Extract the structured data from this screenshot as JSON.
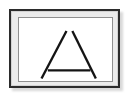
{
  "image": {
    "title": "Framed triangle drawing",
    "width": 133,
    "height": 102,
    "background_color": "#ffffff"
  },
  "frame": {
    "name": "picture-frame",
    "border_color": "#2b2b2b",
    "border_width_px": 2,
    "mat_color": "#ebebeb",
    "mat_border_color": "#d2d2d2",
    "shadow_color": "#b9b9b9",
    "x": 9,
    "y": 9,
    "width": 111,
    "height": 79
  },
  "canvas": {
    "name": "drawing-canvas",
    "background_color": "#ffffff",
    "border_color": "#8f8f8f",
    "x": 6,
    "y": 5,
    "width": 95,
    "height": 65,
    "view_width": 95,
    "view_height": 65
  },
  "drawing": {
    "shape_name": "triangle",
    "stroke_color": "#141414",
    "stroke_width": 2.4,
    "stroke_linecap": "butt",
    "description": "Open triangle sketched with three separate strokes: two legs meeting near the apex with a small gap, and a detached horizontal base line floating above the leg ends.",
    "strokes": [
      {
        "name": "left-leg",
        "x1": 48.5,
        "y1": 13.5,
        "x2": 23.0,
        "y2": 62.5
      },
      {
        "name": "right-leg",
        "x1": 54.5,
        "y1": 13.5,
        "x2": 78.5,
        "y2": 62.5
      },
      {
        "name": "base-line",
        "x1": 29.5,
        "y1": 54.0,
        "x2": 73.0,
        "y2": 54.0
      }
    ]
  }
}
